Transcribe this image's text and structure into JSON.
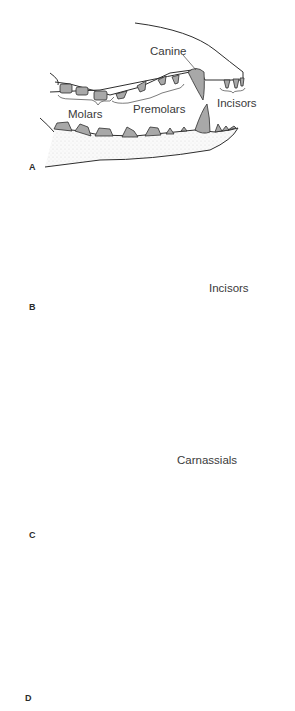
{
  "figure": {
    "colors": {
      "tooth_fill": "#a8a8a8",
      "outline": "#2e2e2e",
      "bone_shade": "#ececec"
    },
    "panels": [
      {
        "id": "A",
        "label": "A",
        "annotations": [
          "Canine",
          "Incisors",
          "Molars",
          "Premolars"
        ]
      },
      {
        "id": "B",
        "label": "B",
        "annotations": [
          "Incisors"
        ]
      },
      {
        "id": "C",
        "label": "C",
        "annotations": [
          "Carnassials"
        ]
      },
      {
        "id": "D",
        "label": "D",
        "annotations": []
      }
    ]
  }
}
